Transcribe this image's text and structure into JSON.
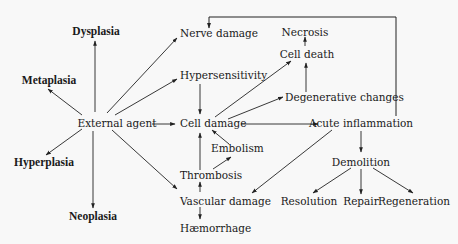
{
  "diagram": {
    "background": "#f8f8f8",
    "line_color": "#222222",
    "nodes": {
      "dysplasia": {
        "label": "Dysplasia",
        "bold": true
      },
      "metaplasia": {
        "label": "Metaplasia",
        "bold": true
      },
      "hyperplasia": {
        "label": "Hyperplasia",
        "bold": true
      },
      "neoplasia": {
        "label": "Neoplasia",
        "bold": true
      },
      "external_agent": {
        "label": "External agent"
      },
      "nerve_damage": {
        "label": "Nerve damage"
      },
      "hypersensitivity": {
        "label": "Hypersensitivity"
      },
      "cell_damage": {
        "label": "Cell damage"
      },
      "embolism": {
        "label": "Embolism"
      },
      "thrombosis": {
        "label": "Thrombosis"
      },
      "vascular_damage": {
        "label": "Vascular damage"
      },
      "haemorrhage": {
        "label": "Hæmorrhage"
      },
      "necrosis": {
        "label": "Necrosis"
      },
      "cell_death": {
        "label": "Cell death"
      },
      "degenerative_changes": {
        "label": "Degenerative changes"
      },
      "acute_inflammation": {
        "label": "Acute inflammation"
      },
      "demolition": {
        "label": "Demolition"
      },
      "resolution": {
        "label": "Resolution"
      },
      "repair": {
        "label": "Repair"
      },
      "regeneration": {
        "label": "Regeneration"
      }
    },
    "edges": [
      {
        "from": "External agent",
        "to": "Dysplasia"
      },
      {
        "from": "External agent",
        "to": "Metaplasia"
      },
      {
        "from": "External agent",
        "to": "Hyperplasia"
      },
      {
        "from": "External agent",
        "to": "Neoplasia"
      },
      {
        "from": "External agent",
        "to": "Nerve damage"
      },
      {
        "from": "External agent",
        "to": "Hypersensitivity"
      },
      {
        "from": "External agent",
        "to": "Cell damage"
      },
      {
        "from": "External agent",
        "to": "Vascular damage"
      },
      {
        "from": "Hypersensitivity",
        "to": "Cell damage"
      },
      {
        "from": "Cell damage",
        "to": "Cell death"
      },
      {
        "from": "Cell damage",
        "to": "Degenerative changes"
      },
      {
        "from": "Cell damage",
        "to": "Acute inflammation"
      },
      {
        "from": "Degenerative changes",
        "to": "Cell death"
      },
      {
        "from": "Cell death",
        "to": "Necrosis"
      },
      {
        "from": "Embolism",
        "to": "Cell damage"
      },
      {
        "from": "Thrombosis",
        "to": "Cell damage"
      },
      {
        "from": "Thrombosis",
        "to": "Embolism"
      },
      {
        "from": "Vascular damage",
        "to": "Thrombosis"
      },
      {
        "from": "Vascular damage",
        "to": "Hæmorrhage"
      },
      {
        "from": "Acute inflammation",
        "to": "Vascular damage"
      },
      {
        "from": "Acute inflammation",
        "to": "Nerve damage"
      },
      {
        "from": "Acute inflammation",
        "to": "Demolition"
      },
      {
        "from": "Demolition",
        "to": "Resolution"
      },
      {
        "from": "Demolition",
        "to": "Repair"
      },
      {
        "from": "Demolition",
        "to": "Regeneration"
      }
    ]
  }
}
